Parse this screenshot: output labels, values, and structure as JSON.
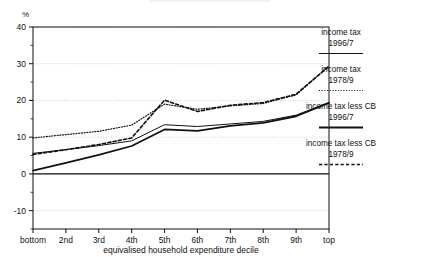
{
  "figure": {
    "unit_label": "%",
    "background_color": "#ffffff",
    "ink_color": "#111111",
    "grid_color": "#bbbbbb"
  },
  "chart_data": {
    "type": "line",
    "title": "",
    "xlabel": "equivalised household expenditure decile",
    "ylabel": "%",
    "categories": [
      "bottom",
      "2nd",
      "3rd",
      "4th",
      "5th",
      "6th",
      "7th",
      "8th",
      "9th",
      "top"
    ],
    "ylim": [
      -15,
      40
    ],
    "xlim": [
      0,
      9
    ],
    "yticks": [
      -10,
      0,
      10,
      20,
      30,
      40
    ],
    "ytick_labels": [
      "-10",
      "0",
      "10",
      "20",
      "30",
      "40"
    ],
    "yminor_ticks": [
      -15,
      -5,
      5,
      15,
      25,
      35
    ],
    "grid": true,
    "grid_axis": "y",
    "legend_position": "right-outside",
    "series": [
      {
        "name": "income tax 1996/7",
        "label_line1": "income tax",
        "label_line2": "1996/7",
        "style": "solid",
        "width": 1.0,
        "color": "#111111",
        "values": [
          5.6,
          6.6,
          7.7,
          9.0,
          13.4,
          12.9,
          13.6,
          14.3,
          16.0,
          19.5
        ]
      },
      {
        "name": "income tax 1978/9",
        "label_line1": "income tax",
        "label_line2": "1978/9",
        "style": "dotted",
        "width": 1.2,
        "color": "#111111",
        "values": [
          9.8,
          10.7,
          11.6,
          13.3,
          19.0,
          17.6,
          18.5,
          19.2,
          21.5,
          29.4
        ]
      },
      {
        "name": "income tax less CB 1996/7",
        "label_line1": "income tax less CB",
        "label_line2": "1996/7",
        "style": "solid",
        "width": 1.8,
        "color": "#111111",
        "values": [
          0.9,
          3.0,
          5.2,
          7.6,
          12.1,
          11.7,
          13.1,
          13.9,
          15.7,
          19.3
        ]
      },
      {
        "name": "income tax less CB 1978/9",
        "label_line1": "income tax less CB",
        "label_line2": "1978/9",
        "style": "dashed",
        "width": 1.6,
        "color": "#111111",
        "values": [
          5.3,
          6.6,
          8.0,
          9.8,
          20.1,
          17.0,
          18.7,
          19.4,
          21.7,
          29.3
        ]
      }
    ]
  }
}
